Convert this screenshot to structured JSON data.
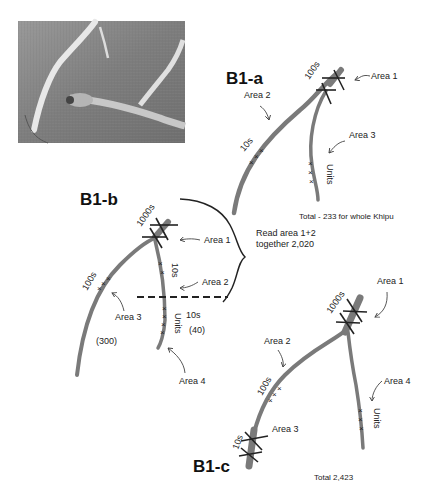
{
  "photo": {
    "description": "Photograph of khipu cord detail",
    "tone": "#8a8a8a"
  },
  "panels": [
    {
      "id": "B1-a",
      "title": "B1-a",
      "labels": {
        "area1": "Area 1",
        "area2": "Area 2",
        "area3": "Area 3",
        "place_100s": "100s",
        "place_10s": "10s",
        "place_units": "Units"
      },
      "total": "Total - 233 for whole Khipu"
    },
    {
      "id": "B1-b",
      "title": "B1-b",
      "labels": {
        "area1": "Area 1",
        "area2": "Area 2",
        "area3": "Area 3",
        "area4": "Area 4",
        "place_1000s": "1000s",
        "place_100s": "100s",
        "place_10s_upper": "10s",
        "place_units": "Units",
        "place_10s_side": "10s",
        "value_40": "(40)",
        "value_300": "(300)"
      },
      "brace_note_line1": "Read area 1+2",
      "brace_note_line2": "together 2,020"
    },
    {
      "id": "B1-c",
      "title": "B1-c",
      "labels": {
        "area1": "Area 1",
        "area2": "Area 2",
        "area3": "Area 3",
        "area4": "Area 4",
        "place_1000s": "1000s",
        "place_100s": "100s",
        "place_10s": "10s",
        "place_units": "Units"
      },
      "total": "Total 2,423"
    }
  ],
  "colors": {
    "cord": "#7a7a7a",
    "ink": "#222222",
    "background": "#ffffff"
  }
}
